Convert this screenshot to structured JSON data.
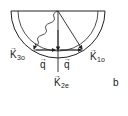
{
  "diagram": {
    "panel_label": "b",
    "vectors": {
      "k3": {
        "symbol": "K",
        "subscript": "3o",
        "arrow": "→"
      },
      "k1": {
        "symbol": "K",
        "subscript": "1o",
        "arrow": "→"
      },
      "k2": {
        "symbol": "K",
        "subscript": "2e",
        "arrow": "→"
      },
      "q_left": {
        "symbol": "q",
        "arrow": "→"
      },
      "q_right": {
        "symbol": "q",
        "arrow": "→"
      }
    },
    "colors": {
      "stroke": "#222222",
      "background": "#ffffff"
    }
  }
}
